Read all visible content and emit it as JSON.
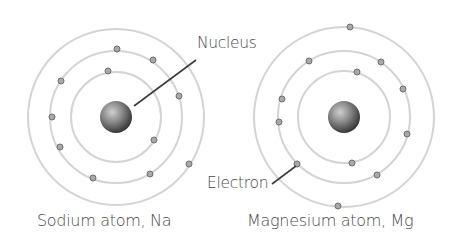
{
  "labels": {
    "nucleus": "Nucleus",
    "electron": "Electron",
    "sodium_caption": "Sodium atom, Na",
    "magnesium_caption": "Magnesium atom, Mg"
  },
  "colors": {
    "orbit": "#d4d4d4",
    "electron_fill": "#a8a8a8",
    "electron_stroke": "#6e6e6e",
    "nucleus_light": "#bdbdbd",
    "nucleus_dark": "#3a3a3a",
    "leader_line": "#3c3c3c",
    "text": "#4a4a4a"
  },
  "atoms": [
    {
      "name": "Sodium atom",
      "symbol": "Na",
      "center": [
        116,
        117
      ],
      "nucleus_radius": 16,
      "orbit_radii": [
        45,
        66,
        88
      ],
      "shell_electron_counts": [
        2,
        8,
        1
      ],
      "electrons": [
        [
          108,
          71
        ],
        [
          154,
          140
        ],
        [
          117,
          49
        ],
        [
          153,
          60
        ],
        [
          179,
          96
        ],
        [
          61,
          81
        ],
        [
          52,
          117
        ],
        [
          60,
          147
        ],
        [
          93,
          178
        ],
        [
          150,
          174
        ],
        [
          189,
          164
        ]
      ]
    },
    {
      "name": "Magnesium atom",
      "symbol": "Mg",
      "center": [
        344,
        117
      ],
      "nucleus_radius": 16,
      "orbit_radii": [
        46,
        66,
        90
      ],
      "shell_electron_counts": [
        2,
        8,
        2
      ],
      "electrons": [
        [
          357,
          72
        ],
        [
          352,
          163
        ],
        [
          309,
          61
        ],
        [
          381,
          62
        ],
        [
          403,
          89
        ],
        [
          282,
          99
        ],
        [
          279,
          122
        ],
        [
          407,
          134
        ],
        [
          297,
          164
        ],
        [
          377,
          175
        ],
        [
          350,
          27
        ],
        [
          338,
          206
        ]
      ]
    }
  ],
  "leaders": {
    "nucleus": [
      [
        134,
        106
      ],
      [
        196,
        60
      ]
    ],
    "electron": [
      [
        296,
        166
      ],
      [
        272,
        184
      ]
    ]
  }
}
